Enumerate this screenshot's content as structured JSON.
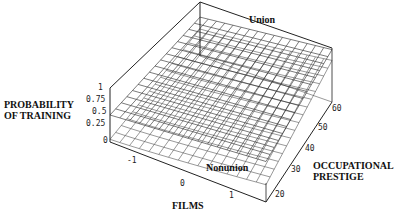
{
  "chart_data": {
    "type": "surface3d",
    "title": "",
    "surface_labels": [
      "Union",
      "Nonunion"
    ],
    "xlabel": "FILMS",
    "ylabel": "OCCUPATIONAL PRESTIGE",
    "zlabel": "PROBABILITY OF TRAINING",
    "x_ticks": [
      "-1",
      "0",
      "1"
    ],
    "y_ticks": [
      "20",
      "30",
      "40",
      "50",
      "60"
    ],
    "z_ticks": [
      "0",
      "0.25",
      "0.5",
      "0.75",
      "1"
    ],
    "xlim": [
      -1.5,
      1.5
    ],
    "ylim": [
      15,
      65
    ],
    "zlim": [
      0,
      1
    ],
    "grid": true
  },
  "labels": {
    "union": "Union",
    "nonunion": "Nonunion",
    "z_axis_line1": "PROBABILITY",
    "z_axis_line2": "OF TRAINING",
    "x_axis": "FILMS",
    "y_axis_line1": "OCCUPATIONAL",
    "y_axis_line2": "PRESTIGE"
  },
  "ticks": {
    "z": [
      "1",
      "0.75",
      "0.5",
      "0.25",
      "0"
    ],
    "x": [
      "-1",
      "0",
      "1"
    ],
    "y": [
      "20",
      "30",
      "40",
      "50",
      "60"
    ]
  }
}
